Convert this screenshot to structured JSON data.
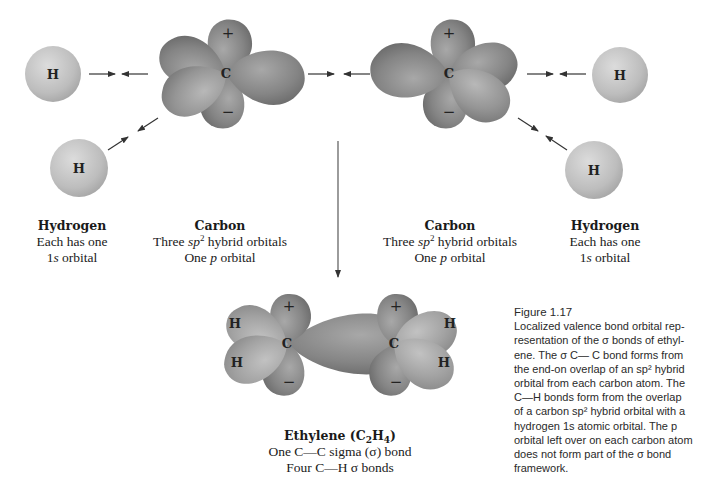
{
  "figure": {
    "number": "Figure 1.17",
    "caption": "Localized valence bond orbital rep-resentation of the σ bonds of ethyl-ene. The σ C— C bond forms from the end-on overlap of an sp² hybrid orbital from each carbon atom. The C—H bonds form from the overlap of a carbon sp² hybrid orbital with a hydrogen 1s atomic orbital. The p orbital left over on each carbon atom does not form part of the σ bond framework.",
    "caption_lines": [
      "Localized valence bond orbital rep-",
      "resentation of the σ bonds of ethyl-",
      "ene. The σ C— C bond forms from",
      "the end-on overlap of an sp² hybrid",
      "orbital from each carbon atom. The",
      "C—H bonds form from the overlap",
      "of a carbon sp² hybrid orbital with a",
      "hydrogen 1s atomic orbital. The p",
      "orbital left over on each carbon atom",
      "does not form part of the σ bond",
      "framework."
    ]
  },
  "atoms": {
    "hydrogen_symbol": "H",
    "carbon_symbol": "C",
    "plus_sign": "+",
    "minus_sign": "−"
  },
  "labels": {
    "hydrogen_left": {
      "title": "Hydrogen",
      "line1": "Each has one",
      "line2_prefix": "1",
      "line2_italic": "s",
      "line2_suffix": " orbital"
    },
    "carbon_left": {
      "title": "Carbon",
      "line1_prefix": "Three ",
      "line1_italic": "sp",
      "line1_sup": "2",
      "line1_suffix": " hybrid orbitals",
      "line2_prefix": "One ",
      "line2_italic": "p",
      "line2_suffix": " orbital"
    },
    "carbon_right": {
      "title": "Carbon",
      "line1_prefix": "Three ",
      "line1_italic": "sp",
      "line1_sup": "2",
      "line1_suffix": " hybrid orbitals",
      "line2_prefix": "One ",
      "line2_italic": "p",
      "line2_suffix": " orbital"
    },
    "hydrogen_right": {
      "title": "Hydrogen",
      "line1": "Each has one",
      "line2_prefix": "1",
      "line2_italic": "s",
      "line2_suffix": " orbital"
    },
    "ethylene": {
      "title_prefix": "Ethylene (C",
      "title_sub1": "2",
      "title_mid": "H",
      "title_sub2": "4",
      "title_suffix": ")",
      "line1": "One C—C sigma (σ) bond",
      "line2": "Four C—H σ bonds"
    }
  },
  "colors": {
    "hydrogen_fill": "#c4c4c4",
    "orbital_fill": "#8a8a8a",
    "orbital_dark": "#6f6f6f",
    "arrow": "#333333",
    "background": "#ffffff"
  }
}
